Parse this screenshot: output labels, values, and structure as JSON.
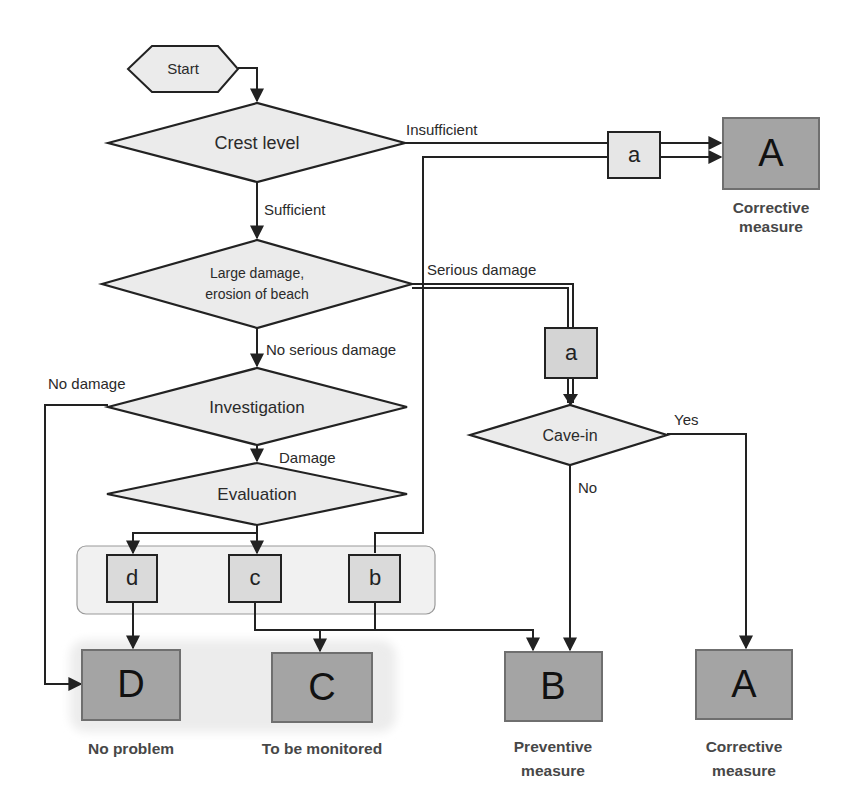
{
  "diagram": {
    "start": "Start",
    "decisions": {
      "crest_level": "Crest level",
      "large_damage_line1": "Large damage,",
      "large_damage_line2": "erosion of beach",
      "investigation": "Investigation",
      "evaluation": "Evaluation",
      "cave_in": "Cave-in"
    },
    "edge_labels": {
      "insufficient": "Insufficient",
      "sufficient": "Sufficient",
      "serious_damage": "Serious damage",
      "no_serious_damage": "No serious damage",
      "no_damage": "No damage",
      "damage": "Damage",
      "yes": "Yes",
      "no": "No"
    },
    "grades": {
      "a_top": "a",
      "a_mid": "a",
      "d": "d",
      "c": "c",
      "b": "b"
    },
    "outcomes": {
      "a_top": {
        "letter": "A",
        "line1": "Corrective",
        "line2": "measure"
      },
      "d": {
        "letter": "D",
        "line1": "No problem"
      },
      "c": {
        "letter": "C",
        "line1": "To be monitored"
      },
      "b": {
        "letter": "B",
        "line1": "Preventive",
        "line2": "measure"
      },
      "a_bottom": {
        "letter": "A",
        "line1": "Corrective",
        "line2": "measure"
      }
    },
    "colors": {
      "decision_fill": "#ebebeb",
      "outcome_fill": "#a4a4a4",
      "grade_fill": "#dadada",
      "group_fill": "#f1f1f1",
      "line": "#222222",
      "caption_text": "#474747"
    }
  }
}
